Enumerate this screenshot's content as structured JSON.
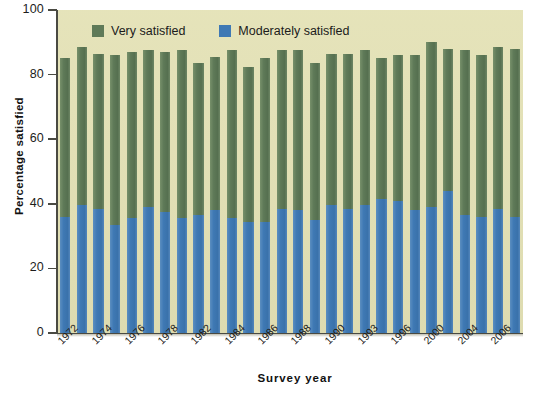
{
  "chart_data": {
    "type": "bar",
    "title": "",
    "subtitle": "",
    "xlabel": "Survey year",
    "ylabel": "Percentage satisfied",
    "ylim": [
      0,
      100
    ],
    "yticks": [
      0,
      20,
      40,
      60,
      80,
      100
    ],
    "grid": false,
    "stacked": true,
    "legend_position": "top-left-inside",
    "legend": [
      "Very satisfied",
      "Moderately satisfied"
    ],
    "colors": {
      "very_satisfied": "#5f7a58",
      "moderately_satisfied": "#3f79b4",
      "plot_background": "#e2e0b5",
      "axis": "#4a4a42",
      "text": "#1d1d1b"
    },
    "categories": [
      "1972",
      "1973",
      "1974",
      "1975",
      "1976",
      "1977",
      "1978",
      "1980",
      "1982",
      "1983",
      "1984",
      "1985",
      "1986",
      "1987",
      "1988",
      "1989",
      "1990",
      "1991",
      "1993",
      "1994",
      "1996",
      "1998",
      "2000",
      "2002",
      "2004",
      "2005",
      "2006",
      "2008"
    ],
    "tick_labels": [
      "1972",
      "",
      "1974",
      "",
      "1976",
      "",
      "1978",
      "",
      "1982",
      "",
      "1984",
      "",
      "1986",
      "",
      "1988",
      "",
      "1990",
      "",
      "1993",
      "",
      "1996",
      "",
      "2000",
      "",
      "2004",
      "",
      "2006",
      ""
    ],
    "series": [
      {
        "name": "Moderately satisfied",
        "color": "#3f79b4",
        "values": [
          36,
          39.5,
          38.5,
          33.5,
          35.5,
          39,
          37.5,
          35.5,
          36.5,
          38,
          35.5,
          34.5,
          34.5,
          38.5,
          38,
          35,
          39.5,
          38.5,
          39.5,
          41.5,
          41,
          38,
          39,
          44,
          36.5,
          36,
          38.5,
          36
        ]
      },
      {
        "name": "Total satisfied (Very + Moderately)",
        "color": "#5f7a58",
        "values": [
          85,
          88.5,
          86.5,
          86,
          87,
          87.5,
          87,
          87.5,
          83.5,
          85.5,
          87.5,
          82.5,
          85,
          87.5,
          87.5,
          83.5,
          86.5,
          86.5,
          87.5,
          85,
          86,
          86,
          90,
          88,
          87.5,
          86,
          88.5,
          88
        ]
      }
    ],
    "very_satisfied_values": [
      49,
      49,
      48,
      52.5,
      51.5,
      48.5,
      49.5,
      52,
      47,
      47.5,
      52,
      48,
      50.5,
      49,
      49.5,
      48.5,
      47,
      48,
      48,
      43.5,
      45,
      48,
      51,
      44,
      51,
      50,
      50,
      52
    ]
  },
  "axes": {
    "y_title": "Percentage satisfied",
    "x_title": "Survey year",
    "y_tick_labels": [
      "100",
      "80",
      "60",
      "40",
      "20",
      "0"
    ]
  },
  "legend": {
    "items": [
      {
        "label": "Very satisfied",
        "color": "#5f7a58"
      },
      {
        "label": "Moderately satisfied",
        "color": "#3f79b4"
      }
    ]
  }
}
